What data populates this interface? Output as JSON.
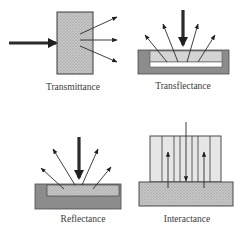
{
  "diagram": {
    "panels": [
      {
        "id": "transmittance",
        "label": "Transmittance"
      },
      {
        "id": "transflectance",
        "label": "Transflectance"
      },
      {
        "id": "reflectance",
        "label": "Reflectance"
      },
      {
        "id": "interactance",
        "label": "Interactance"
      }
    ],
    "colors": {
      "sample_fill": "#c4c4c4",
      "sample_dots": "#8a8a8a",
      "tray_fill": "#8c8c8c",
      "light_fill": "#d9d9d9",
      "probe_fill": "#e6e6e6",
      "stroke": "#2b2b2b"
    }
  }
}
